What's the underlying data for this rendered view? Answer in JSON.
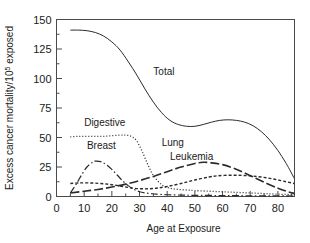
{
  "chart_data": {
    "type": "line",
    "title": "",
    "xlabel": "Age at Exposure",
    "ylabel": "Excess cancer mortality/10⁵ exposed",
    "ylabel_main": "Excess cancer mortality/10",
    "ylabel_sup": "5",
    "ylabel_tail": " exposed",
    "xlim": [
      0,
      86
    ],
    "ylim": [
      0,
      150
    ],
    "xticks": [
      0,
      10,
      20,
      30,
      40,
      50,
      60,
      70,
      80
    ],
    "xtick_labels": [
      "0",
      "10",
      "20",
      "30",
      "40",
      "50",
      "60",
      "70",
      "80"
    ],
    "xminor_step": 5,
    "yticks": [
      0,
      25,
      50,
      75,
      100,
      125,
      150
    ],
    "ytick_labels": [
      "0",
      "25",
      "50",
      "75",
      "100",
      "125",
      "150"
    ],
    "yminor_step": 12.5,
    "grid": false,
    "legend": "inline-annotations",
    "line_color": "#2b2b2b",
    "axis_color": "#4a4a4a",
    "background": "#ffffff",
    "series": [
      {
        "name": "Total",
        "label": "Total",
        "style": "solid",
        "dash": "",
        "width": 1.0,
        "label_x": 35,
        "label_y": 103,
        "x": [
          5,
          8,
          11,
          14,
          17,
          20,
          23,
          26,
          29,
          32,
          35,
          38,
          41,
          44,
          47,
          50,
          53,
          56,
          59,
          62,
          65,
          68,
          71,
          74,
          77,
          80,
          83,
          86
        ],
        "y": [
          141,
          141,
          140.5,
          139,
          136,
          131,
          124,
          114,
          103,
          91,
          80,
          71,
          64.5,
          61,
          59.5,
          59.5,
          61,
          63,
          64.5,
          65,
          64.5,
          63,
          60,
          55,
          48,
          39,
          28,
          15
        ]
      },
      {
        "name": "Digestive",
        "label": "Digestive",
        "style": "dotted",
        "dash": "1,2",
        "width": 1.3,
        "label_x": 10,
        "label_y": 60,
        "x": [
          5,
          8,
          11,
          14,
          17,
          20,
          23,
          25,
          27,
          29,
          31,
          33,
          35,
          38,
          41,
          44,
          47,
          50,
          55,
          60,
          65,
          70,
          75,
          80,
          86
        ],
        "y": [
          50.5,
          51,
          51,
          51,
          51,
          51.5,
          52,
          52,
          51,
          47,
          38,
          27,
          18,
          10,
          7,
          6,
          5.5,
          5,
          4.5,
          4,
          3.5,
          3,
          2.5,
          2,
          1.5
        ]
      },
      {
        "name": "Breast",
        "label": "Breast",
        "style": "dash-dot",
        "dash": "7,2.5,1.5,2.5",
        "width": 1.2,
        "label_x": 11,
        "label_y": 40,
        "x": [
          5,
          7,
          9,
          11,
          13,
          14,
          16,
          18,
          20,
          22,
          24,
          26,
          28,
          30,
          32,
          34,
          36,
          40,
          45,
          50,
          60,
          70,
          80,
          86
        ],
        "y": [
          3,
          10,
          18,
          25,
          29,
          30,
          29.5,
          27,
          23,
          18,
          13,
          9,
          6,
          4,
          3,
          2.5,
          2,
          1.5,
          1.2,
          1,
          0.8,
          0.6,
          0.5,
          0.4
        ]
      },
      {
        "name": "Lung",
        "label": "Lung",
        "style": "long-dash",
        "dash": "9,3",
        "width": 1.6,
        "label_x": 38,
        "label_y": 43,
        "x": [
          5,
          10,
          15,
          20,
          25,
          30,
          35,
          40,
          45,
          50,
          53,
          56,
          60,
          64,
          68,
          72,
          76,
          80,
          83,
          86
        ],
        "y": [
          3,
          4.5,
          6,
          8,
          10.5,
          13.5,
          17,
          21,
          25,
          28,
          29,
          28.5,
          27,
          24,
          20,
          15.5,
          11,
          7,
          4.5,
          2.5
        ]
      },
      {
        "name": "Leukemia",
        "label": "Leukemia",
        "style": "short-dash",
        "dash": "3,2",
        "width": 1.4,
        "label_x": 41,
        "label_y": 31,
        "x": [
          5,
          8,
          12,
          16,
          20,
          24,
          28,
          32,
          36,
          40,
          45,
          50,
          55,
          58,
          62,
          66,
          70,
          74,
          78,
          82,
          86
        ],
        "y": [
          11,
          11.5,
          11.5,
          11,
          10,
          8.5,
          7,
          6.5,
          7,
          8.5,
          11,
          14,
          16.5,
          17.5,
          18,
          18,
          17.5,
          16.5,
          15,
          13,
          11
        ]
      }
    ]
  }
}
